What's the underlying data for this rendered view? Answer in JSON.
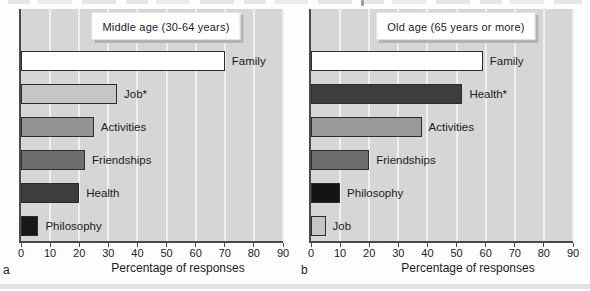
{
  "figure": {
    "x_axis_label": "Percentage of responses",
    "colors": {
      "plot_background": "#d6d6d6",
      "gridline": "#efefef",
      "axis_line": "#4a4a4a",
      "bar_border": "#2c2c2c",
      "title_box_background": "#ffffff",
      "title_box_shadow": "#b4b4b4",
      "text": "#1c1c1c"
    }
  },
  "chart_data": [
    {
      "type": "bar",
      "orientation": "horizontal",
      "title": "Middle age (30-64 years)",
      "panel_label": "a",
      "categories": [
        "Family",
        "Job*",
        "Activities",
        "Friendships",
        "Health",
        "Philosophy"
      ],
      "values": [
        70,
        33,
        25,
        22,
        20,
        6
      ],
      "bar_colors": [
        "#ffffff",
        "#c6c6c6",
        "#949494",
        "#6e6e6e",
        "#3d3d3d",
        "#181818"
      ],
      "xlabel": "Percentage of responses",
      "xlim": [
        0,
        90
      ],
      "xticks": [
        0,
        10,
        20,
        30,
        40,
        50,
        60,
        70,
        80,
        90
      ],
      "grid": true,
      "legend": "none"
    },
    {
      "type": "bar",
      "orientation": "horizontal",
      "title": "Old age (65 years or more)",
      "panel_label": "b",
      "categories": [
        "Family",
        "Health*",
        "Activities",
        "Friendships",
        "Philosophy",
        "Job"
      ],
      "values": [
        59,
        52,
        38,
        20,
        10,
        5
      ],
      "bar_colors": [
        "#ffffff",
        "#3d3d3d",
        "#9a9a9a",
        "#6e6e6e",
        "#141414",
        "#c6c6c6"
      ],
      "xlabel": "Percentage of responses",
      "xlim": [
        0,
        90
      ],
      "xticks": [
        0,
        10,
        20,
        30,
        40,
        50,
        60,
        70,
        80,
        90
      ],
      "grid": true,
      "legend": "none"
    }
  ]
}
